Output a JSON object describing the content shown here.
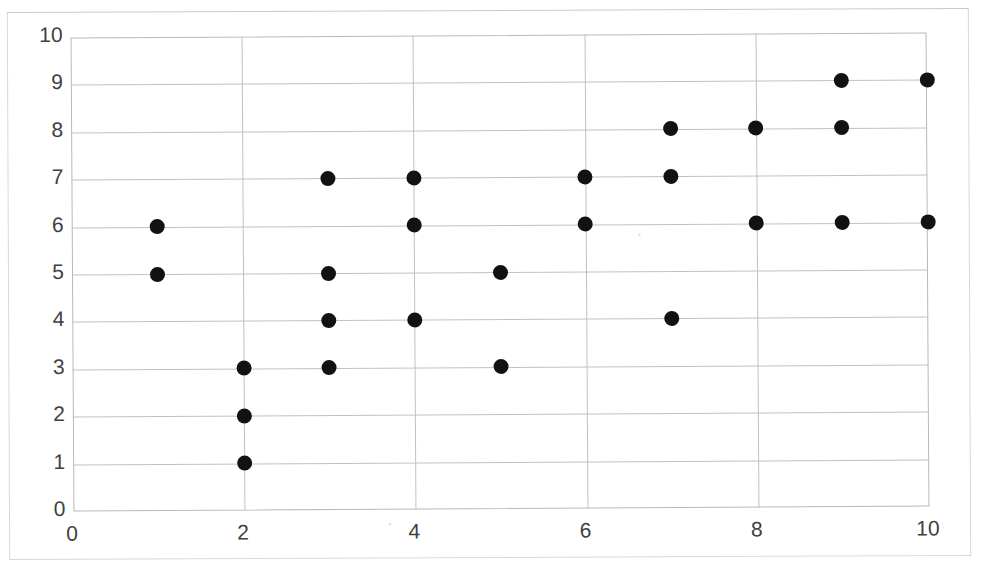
{
  "chart_data": {
    "type": "scatter",
    "title": "",
    "xlabel": "",
    "ylabel": "",
    "xlim": [
      0,
      10
    ],
    "ylim": [
      0,
      10
    ],
    "grid": true,
    "legend": null,
    "x_ticks": [
      "0",
      "2",
      "4",
      "6",
      "8",
      "10"
    ],
    "y_ticks": [
      "0",
      "1",
      "2",
      "3",
      "4",
      "5",
      "6",
      "7",
      "8",
      "9",
      "10"
    ],
    "x_tick_values": [
      0,
      2,
      4,
      6,
      8,
      10
    ],
    "y_tick_values": [
      0,
      1,
      2,
      3,
      4,
      5,
      6,
      7,
      8,
      9,
      10
    ],
    "marker": {
      "shape": "circle",
      "color": "#121212",
      "size_px": 15
    },
    "points": [
      {
        "x": 1,
        "y": 6
      },
      {
        "x": 1,
        "y": 5
      },
      {
        "x": 2,
        "y": 3
      },
      {
        "x": 2,
        "y": 2
      },
      {
        "x": 2,
        "y": 1
      },
      {
        "x": 3,
        "y": 7
      },
      {
        "x": 3,
        "y": 5
      },
      {
        "x": 3,
        "y": 4
      },
      {
        "x": 3,
        "y": 3
      },
      {
        "x": 4,
        "y": 7
      },
      {
        "x": 4,
        "y": 6
      },
      {
        "x": 4,
        "y": 4
      },
      {
        "x": 5,
        "y": 5
      },
      {
        "x": 5,
        "y": 3
      },
      {
        "x": 6,
        "y": 7
      },
      {
        "x": 6,
        "y": 6
      },
      {
        "x": 7,
        "y": 8
      },
      {
        "x": 7,
        "y": 7
      },
      {
        "x": 7,
        "y": 4
      },
      {
        "x": 8,
        "y": 8
      },
      {
        "x": 8,
        "y": 6
      },
      {
        "x": 9,
        "y": 9
      },
      {
        "x": 9,
        "y": 8
      },
      {
        "x": 9,
        "y": 6
      },
      {
        "x": 10,
        "y": 9
      },
      {
        "x": 10,
        "y": 6
      }
    ],
    "n_points": 26,
    "colors": {
      "marker": "#121212",
      "gridline": "#c2c2c2",
      "axis_border": "#b8b8b8",
      "tick_label": "#404040",
      "background": "#ffffff",
      "frame": "#d8d8d8"
    }
  },
  "figure": {
    "title_fragment": "",
    "frame_visible": true
  }
}
